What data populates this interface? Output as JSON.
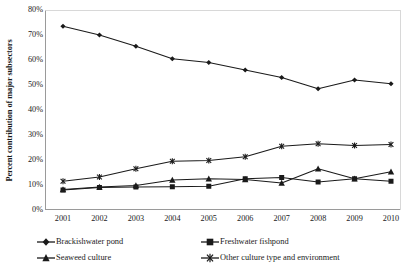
{
  "chart_data": {
    "type": "line",
    "title": "",
    "xlabel": "",
    "ylabel": "Percent contribution of major subsectors",
    "x": [
      2001,
      2002,
      2003,
      2004,
      2005,
      2006,
      2007,
      2008,
      2009,
      2010
    ],
    "categories": [
      "2001",
      "2002",
      "2003",
      "2004",
      "2005",
      "2006",
      "2007",
      "2008",
      "2009",
      "2010"
    ],
    "xtick_labels": [
      "2001",
      "2002",
      "2003",
      "2004",
      "2005",
      "2006",
      "2007",
      "2008",
      "2009",
      "2010"
    ],
    "ytick_labels": [
      "80%",
      "70%",
      "60%",
      "50%",
      "40%",
      "30%",
      "20%",
      "10%",
      "0%"
    ],
    "ytick_values": [
      80,
      70,
      60,
      50,
      40,
      30,
      20,
      10,
      0
    ],
    "ylim": [
      0,
      80
    ],
    "ytick_step": 10,
    "grid": false,
    "legend_position": "bottom",
    "series": [
      {
        "name": "Brackishwater pond",
        "marker": "diamond",
        "color": "#1a1a1a",
        "values": [
          73.5,
          70.0,
          65.5,
          60.5,
          59.0,
          56.0,
          53.0,
          48.5,
          52.0,
          50.5
        ]
      },
      {
        "name": "Freshwater fishpond",
        "marker": "square",
        "color": "#1a1a1a",
        "values": [
          8.0,
          9.0,
          9.2,
          9.3,
          9.5,
          12.5,
          13.0,
          11.2,
          12.5,
          11.5
        ]
      },
      {
        "name": "Seaweed culture",
        "marker": "triangle",
        "color": "#1a1a1a",
        "values": [
          8.2,
          9.2,
          9.8,
          12.0,
          12.5,
          12.2,
          10.8,
          16.5,
          12.5,
          15.3
        ]
      },
      {
        "name": "Other culture type and environment",
        "marker": "star-x",
        "color": "#1a1a1a",
        "values": [
          11.5,
          13.2,
          16.5,
          19.5,
          19.8,
          21.3,
          25.5,
          26.5,
          25.8,
          26.2
        ]
      }
    ]
  },
  "legend": {
    "items": [
      {
        "label": "Brackishwater pond",
        "marker": "diamond"
      },
      {
        "label": "Freshwater fishpond",
        "marker": "square"
      },
      {
        "label": "Seaweed culture",
        "marker": "triangle"
      },
      {
        "label": "Other culture type and environment",
        "marker": "star-x"
      }
    ]
  },
  "colors": {
    "series": "#1a1a1a",
    "axis": "#808080",
    "background": "#ffffff"
  }
}
